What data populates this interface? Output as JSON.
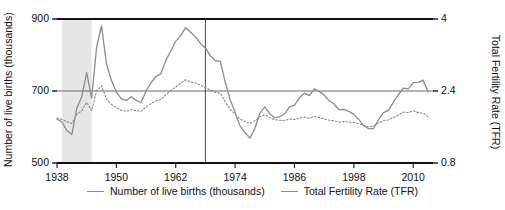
{
  "axes": {
    "y_left_title": "Number of live births (thousands)",
    "y_right_title": "Total Fertility Rate (TFR)",
    "y_left_ticks": [
      "900",
      "700",
      "500"
    ],
    "y_right_ticks": [
      "4",
      "2.4",
      "0.8"
    ],
    "x_ticks": [
      "1938",
      "1950",
      "1962",
      "1974",
      "1986",
      "1998",
      "2010"
    ]
  },
  "legend": {
    "items": [
      {
        "label": "Number of live births (thousands)",
        "color": "#8c8c8c",
        "style": "solid"
      },
      {
        "label": "Total Fertility Rate (TFR)",
        "color": "#8c8c8c",
        "style": "dotted"
      }
    ]
  },
  "colors": {
    "births_line": "#8c8c8c",
    "tfr_line": "#8c8c8c",
    "axis": "#111111",
    "gridline": "#555555",
    "shaded_band": "#e6e6e6",
    "marker_line": "#333333"
  },
  "chart_data": {
    "type": "line",
    "title": "",
    "xlabel": "",
    "ylabel": "Number of live births (thousands)",
    "y2label": "Total Fertility Rate (TFR)",
    "xlim": [
      1938,
      2014
    ],
    "ylim": [
      500,
      900
    ],
    "y2lim": [
      0.8,
      4.0
    ],
    "grid": true,
    "gridlines": {
      "y_left": [
        700
      ],
      "y_right": [
        2.4
      ]
    },
    "legend_position": "bottom-center",
    "annotations": [
      {
        "type": "vspan",
        "label": "Second World War",
        "x_start": 1939,
        "x_end": 1945,
        "color": "#e6e6e6"
      },
      {
        "type": "vline",
        "label": "1968",
        "x": 1968,
        "color": "#333333"
      }
    ],
    "x": [
      1938,
      1939,
      1940,
      1941,
      1942,
      1943,
      1944,
      1945,
      1946,
      1947,
      1948,
      1949,
      1950,
      1951,
      1952,
      1953,
      1954,
      1955,
      1956,
      1957,
      1958,
      1959,
      1960,
      1961,
      1962,
      1963,
      1964,
      1965,
      1966,
      1967,
      1968,
      1969,
      1970,
      1971,
      1972,
      1973,
      1974,
      1975,
      1976,
      1977,
      1978,
      1979,
      1980,
      1981,
      1982,
      1983,
      1984,
      1985,
      1986,
      1987,
      1988,
      1989,
      1990,
      1991,
      1992,
      1993,
      1994,
      1995,
      1996,
      1997,
      1998,
      1999,
      2000,
      2001,
      2002,
      2003,
      2004,
      2005,
      2006,
      2007,
      2008,
      2009,
      2010,
      2011,
      2012,
      2013
    ],
    "series": [
      {
        "name": "Number of live births (thousands)",
        "axis": "left",
        "style": "solid",
        "color": "#8c8c8c",
        "values": [
          622,
          614,
          590,
          579,
          652,
          684,
          751,
          680,
          821,
          881,
          775,
          730,
          697,
          678,
          674,
          684,
          674,
          668,
          700,
          723,
          740,
          748,
          785,
          811,
          838,
          854,
          876,
          863,
          850,
          832,
          819,
          798,
          784,
          783,
          725,
          676,
          640,
          603,
          584,
          569,
          596,
          638,
          656,
          637,
          625,
          629,
          636,
          656,
          661,
          681,
          694,
          687,
          706,
          699,
          689,
          673,
          664,
          648,
          649,
          643,
          635,
          621,
          604,
          595,
          596,
          621,
          640,
          646,
          669,
          690,
          708,
          706,
          723,
          724,
          730,
          698
        ]
      },
      {
        "name": "Total Fertility Rate (TFR)",
        "axis": "right",
        "style": "dotted",
        "color": "#8c8c8c",
        "values": [
          1.8,
          1.77,
          1.72,
          1.68,
          1.88,
          1.96,
          2.15,
          1.96,
          2.4,
          2.52,
          2.22,
          2.1,
          2.03,
          1.97,
          1.95,
          1.99,
          1.96,
          1.95,
          2.05,
          2.12,
          2.18,
          2.21,
          2.32,
          2.41,
          2.49,
          2.57,
          2.65,
          2.6,
          2.58,
          2.53,
          2.48,
          2.42,
          2.37,
          2.35,
          2.16,
          1.99,
          1.89,
          1.78,
          1.72,
          1.68,
          1.74,
          1.83,
          1.87,
          1.81,
          1.76,
          1.75,
          1.74,
          1.78,
          1.77,
          1.8,
          1.82,
          1.79,
          1.83,
          1.81,
          1.78,
          1.75,
          1.74,
          1.71,
          1.72,
          1.71,
          1.7,
          1.67,
          1.63,
          1.6,
          1.62,
          1.69,
          1.74,
          1.76,
          1.81,
          1.87,
          1.93,
          1.92,
          1.96,
          1.92,
          1.91,
          1.83
        ]
      }
    ]
  }
}
